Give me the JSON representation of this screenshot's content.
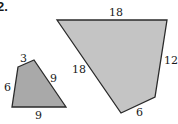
{
  "problem": {
    "number_label": "2."
  },
  "colors": {
    "fill_small": "#a9a9a9",
    "fill_large": "#c4c4c4",
    "stroke": "#2a2a2a",
    "text": "#1a1a1a"
  },
  "small_quadrilateral": {
    "side_labels": {
      "top": "3",
      "left": "6",
      "right": "9",
      "bottom": "9"
    }
  },
  "large_quadrilateral": {
    "side_labels": {
      "top": "18",
      "left": "18",
      "right": "12",
      "bottom": "6"
    }
  }
}
